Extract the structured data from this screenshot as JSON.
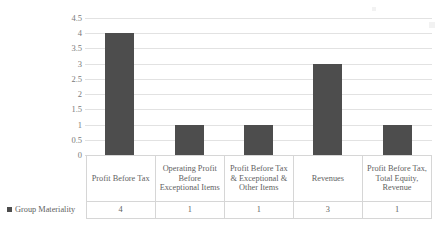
{
  "chart_data": {
    "type": "bar",
    "title": "",
    "xlabel": "",
    "ylabel": "",
    "ylim": [
      0,
      4.5
    ],
    "grid": true,
    "legend_position": "data-table-left",
    "series_name": "Group Materiality",
    "series_color": "#4d4d4d",
    "categories": [
      "Profit Before Tax",
      "Operating Profit Before Exceptional Items",
      "Profit Before Tax & Exceptional & Other Items",
      "Revenues",
      "Profit Before Tax, Total Equity, Revenue"
    ],
    "values": [
      4,
      1,
      1,
      3,
      1
    ],
    "value_labels": [
      "4",
      "1",
      "1",
      "3",
      "1"
    ],
    "y_ticks": [
      "0",
      "0.5",
      "1",
      "1.5",
      "2",
      "2.5",
      "3",
      "3.5",
      "4",
      "4.5"
    ],
    "y_tick_values": [
      0,
      0.5,
      1,
      1.5,
      2,
      2.5,
      3,
      3.5,
      4,
      4.5
    ]
  },
  "table": {
    "legend_label": "Group Materiality",
    "legend_marker": "square-marker-icon"
  },
  "colors": {
    "bar": "#4d4d4d",
    "gridline": "#e2e2e2",
    "table_border": "#d6d6d6",
    "text": "#5f5f5f",
    "background": "#ffffff"
  }
}
